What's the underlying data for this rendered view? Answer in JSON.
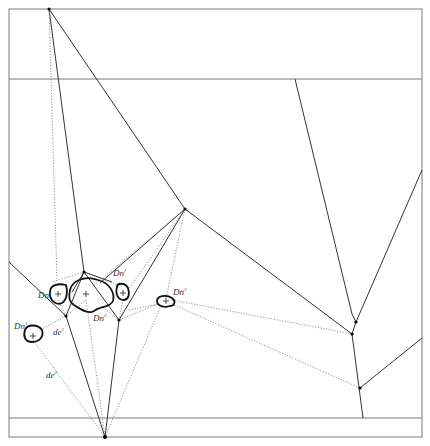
{
  "diagram": {
    "type": "path-planning voronoi roadmap with obstacles",
    "frame": {
      "left": 9,
      "right": 422,
      "top": 9,
      "bottom": 437,
      "upper_band_y": 79,
      "lower_band_y": 418
    },
    "labels": {
      "dn1a": "Dn",
      "dn1a_sup": "1",
      "dn1b": "Dn",
      "dn1b_sup": "1",
      "dn1c": "Dn",
      "dn1c_sup": "1",
      "dn2": "Dn",
      "dn2_sup": "2",
      "dn3": "Dn",
      "dn3_sup": "3",
      "de1": "de",
      "de1_sup": "1",
      "de2": "de",
      "de2_sup": "2"
    },
    "obstacles": [
      {
        "name": "left-small",
        "center": [
          33,
          335
        ]
      },
      {
        "name": "left-upper",
        "center": [
          58,
          293
        ]
      },
      {
        "name": "center-large",
        "center": [
          86,
          295
        ]
      },
      {
        "name": "center-right-small",
        "center": [
          123,
          292
        ]
      },
      {
        "name": "right-small",
        "center": [
          166,
          302
        ]
      }
    ],
    "nodes": [
      [
        49,
        9
      ],
      [
        84,
        272
      ],
      [
        66,
        316
      ],
      [
        119,
        320
      ],
      [
        185,
        209
      ],
      [
        105,
        437
      ],
      [
        352,
        334
      ],
      [
        356,
        322
      ],
      [
        360,
        388
      ]
    ]
  }
}
